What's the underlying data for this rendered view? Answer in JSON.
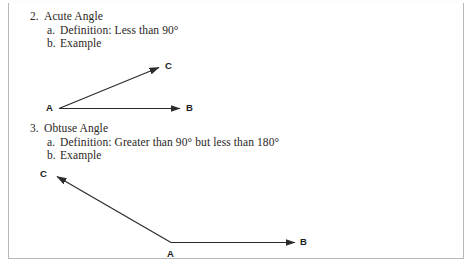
{
  "page": {
    "background_color": "#ffffff",
    "frame_color": "#b7b7b7",
    "ink_color": "#231f20"
  },
  "outline": [
    {
      "number": "2.",
      "title": "Acute Angle",
      "subitems": [
        {
          "marker": "a.",
          "text": "Definition:  Less than 90°"
        },
        {
          "marker": "b.",
          "text": "Example"
        }
      ]
    },
    {
      "number": "3.",
      "title": "Obtuse Angle",
      "subitems": [
        {
          "marker": "a.",
          "text": "Definition: Greater than 90° but less than 180°"
        },
        {
          "marker": "b.",
          "text": "Example"
        }
      ]
    }
  ],
  "diagrams": [
    {
      "name": "acute-angle-diagram",
      "vertex_label": "A",
      "ray_labels": [
        "B",
        "C"
      ],
      "stroke_color": "#2b2b2b"
    },
    {
      "name": "obtuse-angle-diagram",
      "vertex_label": "A",
      "ray_labels": [
        "B",
        "C"
      ],
      "stroke_color": "#2b2b2b"
    }
  ]
}
